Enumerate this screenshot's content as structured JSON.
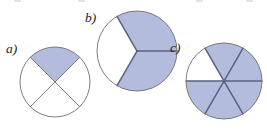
{
  "figure": {
    "background_color": "#ffffff",
    "shade_color": "#b4bcdd",
    "divider_color": "#5a6080",
    "thin_outline_color": "#6e6e72",
    "label_color": "#1d1d1d",
    "parts": [
      {
        "id": "a",
        "label": "a)",
        "label_x": 6,
        "label_y": 53,
        "center_x": 55,
        "center_y": 82,
        "radius": 35,
        "sectors_total": 4,
        "sectors_shaded": 1,
        "fraction": "1/4",
        "start_angle_deg": 45,
        "sector_span_deg": 90,
        "shaded_indices": [
          0
        ],
        "outline_color": "#6e6e72",
        "outline_width": 0.9,
        "divider_color": "#6e6e72",
        "divider_width": 0.9
      },
      {
        "id": "b",
        "label": "b)",
        "label_x": 85,
        "label_y": 22,
        "center_x": 137,
        "center_y": 51,
        "radius": 40,
        "sectors_total": 3,
        "sectors_shaded": 2,
        "fraction": "2/3",
        "start_angle_deg": 0,
        "sector_span_deg": 120,
        "shaded_indices": [
          0,
          2
        ],
        "outline_color": "#6e6e72",
        "outline_width": 0.9,
        "divider_color": "#5a6080",
        "divider_width": 1.5
      },
      {
        "id": "c",
        "label": "c)",
        "label_x": 170,
        "label_y": 52,
        "center_x": 224,
        "center_y": 81,
        "radius": 38,
        "sectors_total": 6,
        "sectors_shaded": 5,
        "fraction": "5/6",
        "start_angle_deg": 0,
        "sector_span_deg": 60,
        "shaded_indices": [
          0,
          1,
          3,
          4,
          5
        ],
        "outline_color": "#6e6e72",
        "outline_width": 0.9,
        "divider_color": "#5a6080",
        "divider_width": 1.5
      }
    ],
    "top_ghost_marks": [
      {
        "x": 14
      },
      {
        "x": 78
      },
      {
        "x": 196
      },
      {
        "x": 246
      }
    ]
  }
}
